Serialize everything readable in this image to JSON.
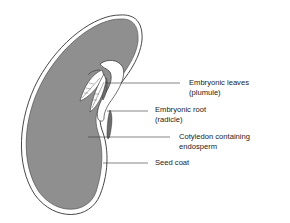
{
  "diagram": {
    "colors": {
      "cotyledon_fill": "#8f8f8f",
      "seed_coat": "#ffffff",
      "outline": "#333333",
      "background": "#ffffff"
    },
    "labels": [
      {
        "id": "plumule",
        "line1": "Embryonic leaves",
        "line2": "(plumule)"
      },
      {
        "id": "radicle",
        "line1": "Embryonic root",
        "line2": "(radicle)"
      },
      {
        "id": "cotyledon",
        "line1": "Cotyledon containing",
        "line2": "endosperm"
      },
      {
        "id": "seed-coat",
        "line1": "Seed coat",
        "line2": ""
      }
    ]
  }
}
